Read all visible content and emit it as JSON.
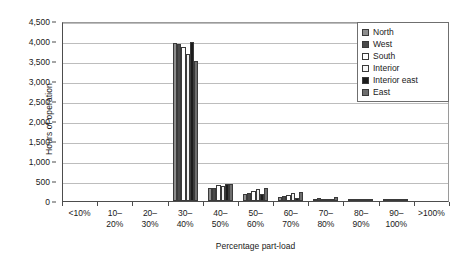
{
  "chart_data": {
    "type": "bar",
    "title": "",
    "xlabel": "Percentage part-load",
    "ylabel": "Hours of operation",
    "ylim": [
      0,
      4500
    ],
    "ytick_step": 500,
    "yticks": [
      "0",
      "500",
      "1,000",
      "1,500",
      "2,000",
      "2,500",
      "3,000",
      "3,500",
      "4,000",
      "4,500"
    ],
    "grid": true,
    "legend_position": "top-right",
    "categories": [
      "<10%",
      "10–\n20%",
      "20–\n30%",
      "30–\n40%",
      "40–\n50%",
      "50–\n60%",
      "60–\n70%",
      "70–\n80%",
      "80–\n90%",
      "90–\n100%",
      ">100%"
    ],
    "category_lines": [
      [
        "<10%",
        ""
      ],
      [
        "10–",
        "20%"
      ],
      [
        "20–",
        "30%"
      ],
      [
        "30–",
        "40%"
      ],
      [
        "40–",
        "50%"
      ],
      [
        "50–",
        "60%"
      ],
      [
        "60–",
        "70%"
      ],
      [
        "70–",
        "80%"
      ],
      [
        "80–",
        "90%"
      ],
      [
        "90–",
        "100%"
      ],
      [
        ">100%",
        ""
      ]
    ],
    "series": [
      {
        "name": "North",
        "color": "#8e8e8e",
        "values": [
          0,
          0,
          0,
          3950,
          330,
          170,
          95,
          60,
          25,
          10,
          0
        ]
      },
      {
        "name": "West",
        "color": "#4a4a4a",
        "values": [
          0,
          0,
          0,
          3930,
          320,
          200,
          120,
          75,
          20,
          8,
          0
        ]
      },
      {
        "name": "South",
        "color": "#ffffff",
        "values": [
          0,
          0,
          0,
          3850,
          400,
          250,
          140,
          40,
          15,
          5,
          0
        ]
      },
      {
        "name": "Interior",
        "color": "#f2f2f2",
        "values": [
          0,
          0,
          0,
          3680,
          370,
          300,
          190,
          50,
          18,
          6,
          0
        ]
      },
      {
        "name": "Interior east",
        "color": "#1c1c1c",
        "values": [
          0,
          0,
          0,
          3980,
          430,
          180,
          70,
          45,
          22,
          8,
          0
        ]
      },
      {
        "name": "East",
        "color": "#6e6e6e",
        "values": [
          0,
          0,
          0,
          3500,
          430,
          330,
          230,
          110,
          30,
          12,
          0
        ]
      }
    ]
  }
}
